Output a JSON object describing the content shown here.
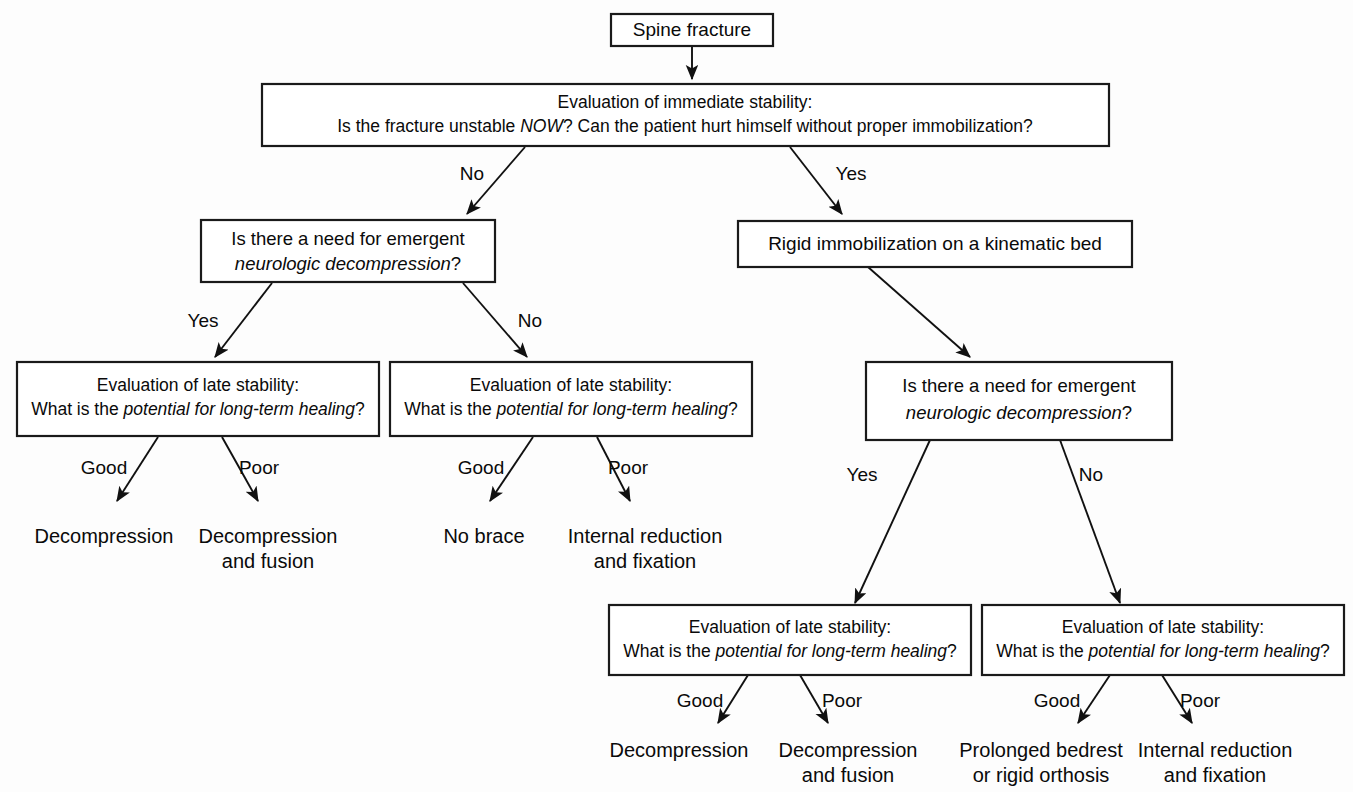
{
  "diagram": {
    "background_color": "#fdfdfd",
    "line_color": "#111111",
    "text_color": "#0a0a0a"
  },
  "nodes": {
    "root": {
      "text": "Spine fracture"
    },
    "immediate_stability": {
      "line1": "Evaluation of immediate stability:",
      "line2_a": "Is the fracture unstable ",
      "line2_italic": "NOW",
      "line2_b": "? Can the patient hurt himself without proper immobilization?"
    },
    "neuro_left": {
      "line1": "Is there a need for emergent",
      "line2_italic": "neurologic decompression",
      "line2_tail": "?"
    },
    "rigid_immobilization": {
      "text": "Rigid immobilization on a kinematic bed"
    },
    "neuro_right": {
      "line1": "Is there a need for emergent",
      "line2_italic": "neurologic decompression",
      "line2_tail": "?"
    },
    "late_stability_1": {
      "line1": "Evaluation of late stability:",
      "line2_a": "What is the ",
      "line2_italic": "potential for long-term healing",
      "line2_b": "?"
    },
    "late_stability_2": {
      "line1": "Evaluation of late stability:",
      "line2_a": "What is the ",
      "line2_italic": "potential for long-term healing",
      "line2_b": "?"
    },
    "late_stability_3": {
      "line1": "Evaluation of late stability:",
      "line2_a": "What is the ",
      "line2_italic": "potential for long-term healing",
      "line2_b": "?"
    },
    "late_stability_4": {
      "line1": "Evaluation of late stability:",
      "line2_a": "What is the ",
      "line2_italic": "potential for long-term healing",
      "line2_b": "?"
    }
  },
  "edge_labels": {
    "immediate_no": "No",
    "immediate_yes": "Yes",
    "neuro_left_yes": "Yes",
    "neuro_left_no": "No",
    "neuro_right_yes": "Yes",
    "neuro_right_no": "No",
    "ls1_good": "Good",
    "ls1_poor": "Poor",
    "ls2_good": "Good",
    "ls2_poor": "Poor",
    "ls3_good": "Good",
    "ls3_poor": "Poor",
    "ls4_good": "Good",
    "ls4_poor": "Poor"
  },
  "outcomes": {
    "ls1_good": {
      "line1": "Decompression",
      "line2": ""
    },
    "ls1_poor": {
      "line1": "Decompression",
      "line2": "and fusion"
    },
    "ls2_good": {
      "line1": "No brace",
      "line2": ""
    },
    "ls2_poor": {
      "line1": "Internal reduction",
      "line2": "and fixation"
    },
    "ls3_good": {
      "line1": "Decompression",
      "line2": ""
    },
    "ls3_poor": {
      "line1": "Decompression",
      "line2": "and fusion"
    },
    "ls4_good": {
      "line1": "Prolonged bedrest",
      "line2": "or rigid orthosis"
    },
    "ls4_poor": {
      "line1": "Internal reduction",
      "line2": "and fixation"
    }
  }
}
